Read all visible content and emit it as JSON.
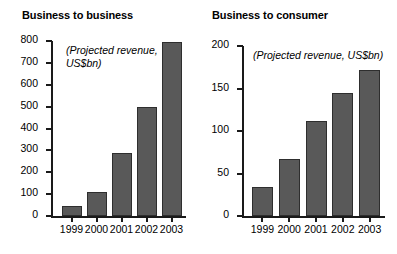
{
  "chart_data": [
    {
      "type": "bar",
      "title": "Business to business",
      "annotation": "(Projected revenue,\nUS$bn)",
      "categories": [
        "1999",
        "2000",
        "2001",
        "2002",
        "2003"
      ],
      "values": [
        48,
        112,
        288,
        500,
        795
      ],
      "xlabel": "",
      "ylabel": "",
      "ylim": [
        0,
        800
      ],
      "yticks": [
        0,
        100,
        200,
        300,
        400,
        500,
        600,
        700,
        800
      ],
      "ytick_labels": [
        "0",
        "100",
        "200",
        "300",
        "400",
        "500",
        "600",
        "700",
        "800"
      ],
      "grid": false,
      "legend": "none",
      "bar_color": "#595959",
      "bar_edge_color": "#2e2e2e"
    },
    {
      "type": "bar",
      "title": "Business to consumer",
      "annotation": "(Projected revenue, US$bn)",
      "categories": [
        "1999",
        "2000",
        "2001",
        "2002",
        "2003"
      ],
      "values": [
        34,
        67,
        112,
        145,
        172
      ],
      "xlabel": "",
      "ylabel": "",
      "ylim": [
        0,
        200
      ],
      "yticks": [
        0,
        50,
        100,
        150,
        200
      ],
      "ytick_labels": [
        "0",
        "50",
        "100",
        "150",
        "200"
      ],
      "grid": false,
      "legend": "none",
      "bar_color": "#595959",
      "bar_edge_color": "#2e2e2e"
    }
  ]
}
